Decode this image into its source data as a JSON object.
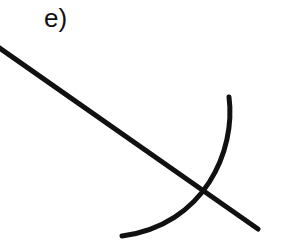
{
  "figure": {
    "label": "e)",
    "stroke_color": "#111111",
    "elements": [
      {
        "type": "line",
        "name": "straight-line",
        "from": [
          0,
          48
        ],
        "to": [
          258,
          229
        ]
      },
      {
        "type": "arc",
        "name": "curved-arc",
        "start": [
          229,
          97
        ],
        "end": [
          121,
          236
        ]
      }
    ]
  }
}
